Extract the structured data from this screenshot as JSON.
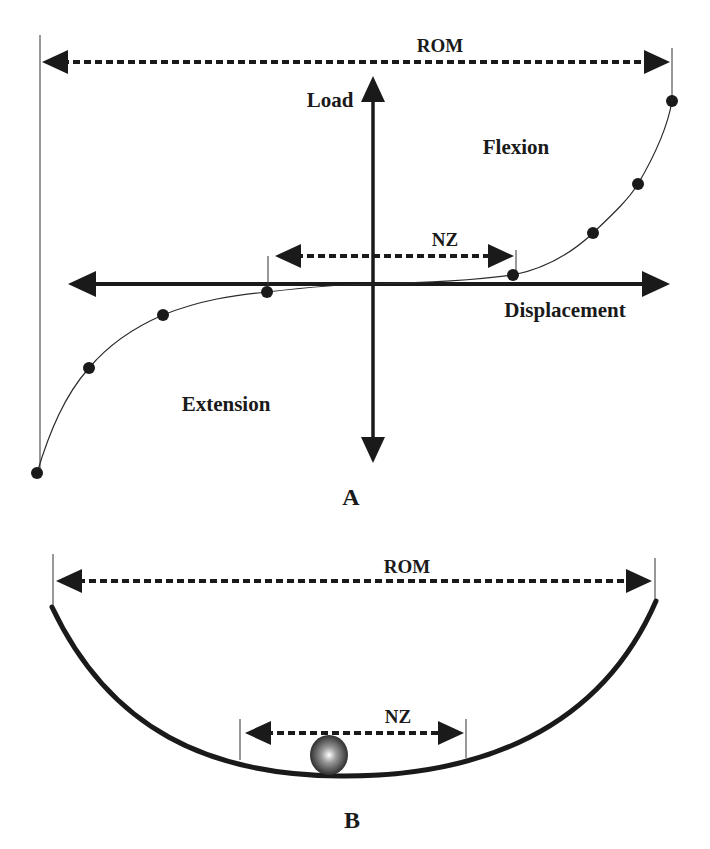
{
  "panel_a": {
    "label": "A",
    "rom_label": "ROM",
    "nz_label": "NZ",
    "y_axis_label": "Load",
    "x_axis_label": "Displacement",
    "region_upper": "Flexion",
    "region_lower": "Extension",
    "curve_points": [
      {
        "x": 37,
        "y": 473
      },
      {
        "x": 89,
        "y": 368
      },
      {
        "x": 163,
        "y": 315
      },
      {
        "x": 267,
        "y": 292
      },
      {
        "x": 513,
        "y": 275
      },
      {
        "x": 593,
        "y": 233
      },
      {
        "x": 638,
        "y": 184
      },
      {
        "x": 672,
        "y": 101
      }
    ]
  },
  "panel_b": {
    "label": "B",
    "rom_label": "ROM",
    "nz_label": "NZ"
  },
  "colors": {
    "ink": "#1a1a1a",
    "background": "#ffffff"
  }
}
